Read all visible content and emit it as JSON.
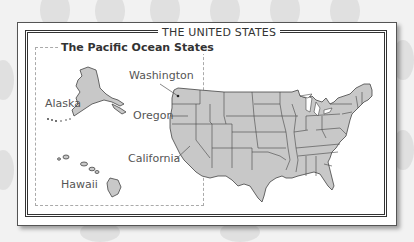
{
  "map": {
    "title": "THE UNITED STATES",
    "inset_title": "The Pacific Ocean States",
    "labels": {
      "washington": "Washington",
      "oregon": "Oregon",
      "california": "California",
      "alaska": "Alaska",
      "hawaii": "Hawaii"
    },
    "colors": {
      "state_fill": "#c8c8c8",
      "state_border": "#444444",
      "frame": "#333333",
      "background": "#f2f2f2",
      "dashed_box": "#aaaaaa"
    }
  }
}
